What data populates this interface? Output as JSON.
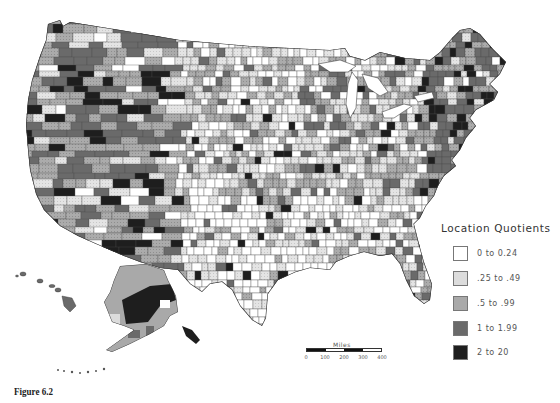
{
  "figure": {
    "caption": "Figure 6.2"
  },
  "legend": {
    "title": "Location Quotients",
    "items": [
      {
        "label": "0 to 0.24",
        "color": "#ffffff"
      },
      {
        "label": ".25 to .49",
        "color": "#dcdcdc"
      },
      {
        "label": ".5 to .99",
        "color": "#a9a9a9"
      },
      {
        "label": "1 to 1.99",
        "color": "#6a6a6a"
      },
      {
        "label": "2 to 20",
        "color": "#1e1e1e"
      }
    ]
  },
  "scale_bar": {
    "title": "Miles",
    "ticks": [
      "0",
      "100",
      "200",
      "300",
      "400"
    ]
  },
  "map": {
    "subject": "United States counties choropleth",
    "insets": [
      "Alaska",
      "Hawaii"
    ],
    "border_color": "#3a3a3a"
  }
}
